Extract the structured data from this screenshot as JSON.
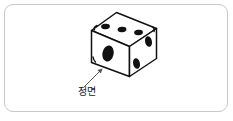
{
  "figure": {
    "kind": "dice-line-drawing",
    "alt_description": "Isometric line drawing of a six-sided die with an arrow labelled 정면 pointing at the front-left face",
    "border_color": "#c9c9c9",
    "background_color": "#ffffff",
    "ink_color": "#111111",
    "leader_color": "#555555"
  },
  "die": {
    "faces": [
      {
        "id": "top",
        "name": "top-face",
        "pip_count": 3,
        "arrangement": "diagonal-row"
      },
      {
        "id": "front",
        "name": "front-face",
        "pip_count": 1,
        "arrangement": "center"
      },
      {
        "id": "right",
        "name": "right-face",
        "pip_count": 2,
        "arrangement": "diagonal-pair"
      }
    ],
    "total_visible_pips": 6
  },
  "annotation": {
    "label": "정면",
    "points_at": "front",
    "arrow": "up-right"
  }
}
